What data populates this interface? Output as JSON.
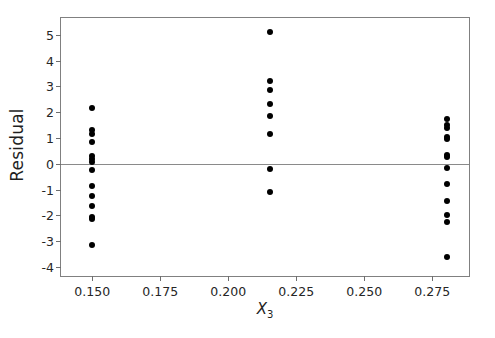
{
  "chart_data": {
    "type": "scatter",
    "title": "",
    "xlabel": "X3",
    "xlabel_base": "X",
    "xlabel_sub": "3",
    "ylabel": "Residual",
    "xlim": [
      0.1385,
      0.2885
    ],
    "ylim": [
      -4.35,
      5.65
    ],
    "grid": false,
    "legend": null,
    "xticks": [
      0.15,
      0.175,
      0.2,
      0.225,
      0.25,
      0.275
    ],
    "xticklabels": [
      "0.150",
      "0.175",
      "0.200",
      "0.225",
      "0.250",
      "0.275"
    ],
    "yticks": [
      5,
      4,
      3,
      2,
      1,
      0,
      -1,
      -2,
      -3,
      -4
    ],
    "yticklabels": [
      "5",
      "4",
      "3",
      "2",
      "1",
      "0",
      "-1",
      "-2",
      "-3",
      "-4"
    ],
    "reference_lines": [
      {
        "axis": "y",
        "value": 0,
        "color": "#8a8a8a"
      }
    ],
    "marker": {
      "shape": "circle",
      "color": "#000000",
      "size": 6
    },
    "groups": [
      {
        "name": "x3 = 0.150",
        "x": 0.15,
        "y": [
          2.15,
          1.3,
          1.15,
          0.85,
          0.3,
          0.2,
          0.05,
          -0.25,
          -0.85,
          -1.25,
          -1.65,
          -2.05,
          -2.15,
          -3.15
        ]
      },
      {
        "name": "x3 = 0.215",
        "x": 0.2155,
        "y": [
          5.1,
          3.2,
          2.85,
          2.3,
          1.85,
          1.15,
          -0.2,
          -1.1
        ]
      },
      {
        "name": "x3 = 0.280",
        "x": 0.2805,
        "y": [
          1.75,
          1.5,
          1.4,
          1.05,
          0.95,
          0.35,
          0.25,
          -0.15,
          -0.8,
          -1.45,
          -2.0,
          -2.25,
          -3.6
        ]
      }
    ],
    "points": [
      {
        "x": 0.15,
        "y": 2.15
      },
      {
        "x": 0.15,
        "y": 1.3
      },
      {
        "x": 0.15,
        "y": 1.15
      },
      {
        "x": 0.15,
        "y": 0.85
      },
      {
        "x": 0.15,
        "y": 0.3
      },
      {
        "x": 0.15,
        "y": 0.2
      },
      {
        "x": 0.15,
        "y": 0.05
      },
      {
        "x": 0.15,
        "y": -0.25
      },
      {
        "x": 0.15,
        "y": -0.85
      },
      {
        "x": 0.15,
        "y": -1.25
      },
      {
        "x": 0.15,
        "y": -1.65
      },
      {
        "x": 0.15,
        "y": -2.05
      },
      {
        "x": 0.15,
        "y": -2.15
      },
      {
        "x": 0.15,
        "y": -3.15
      },
      {
        "x": 0.2155,
        "y": 5.1
      },
      {
        "x": 0.2155,
        "y": 3.2
      },
      {
        "x": 0.2155,
        "y": 2.85
      },
      {
        "x": 0.2155,
        "y": 2.3
      },
      {
        "x": 0.2155,
        "y": 1.85
      },
      {
        "x": 0.2155,
        "y": 1.15
      },
      {
        "x": 0.2155,
        "y": -0.2
      },
      {
        "x": 0.2155,
        "y": -1.1
      },
      {
        "x": 0.2805,
        "y": 1.75
      },
      {
        "x": 0.2805,
        "y": 1.5
      },
      {
        "x": 0.2805,
        "y": 1.4
      },
      {
        "x": 0.2805,
        "y": 1.05
      },
      {
        "x": 0.2805,
        "y": 0.95
      },
      {
        "x": 0.2805,
        "y": 0.35
      },
      {
        "x": 0.2805,
        "y": 0.25
      },
      {
        "x": 0.2805,
        "y": -0.15
      },
      {
        "x": 0.2805,
        "y": -0.8
      },
      {
        "x": 0.2805,
        "y": -1.45
      },
      {
        "x": 0.2805,
        "y": -2.0
      },
      {
        "x": 0.2805,
        "y": -2.25
      },
      {
        "x": 0.2805,
        "y": -3.6
      }
    ]
  }
}
